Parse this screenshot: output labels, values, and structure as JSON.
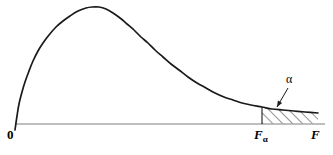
{
  "figure": {
    "type": "probability-density-curve",
    "background_color": "#ffffff",
    "curve_color": "#1a1a1a",
    "axis_color": "#a8a8a8",
    "hatch_color": "#1a1a1a",
    "width": 333,
    "height": 155
  },
  "labels": {
    "origin": "0",
    "critical_value_base": "F",
    "critical_value_subscript": "α",
    "axis_variable": "F",
    "shaded_area": "α"
  },
  "chart_data": {
    "type": "line",
    "title": "",
    "subtitle": "",
    "xlabel": "F",
    "ylabel": "",
    "grid": false,
    "legend": null,
    "xlim": [
      0,
      1
    ],
    "ylim": [
      0,
      1
    ],
    "tick_labels_x": [
      "0",
      "Fα",
      "F"
    ],
    "tick_labels_y": [],
    "annotations": [
      {
        "text": "α",
        "meaning": "area of right-tail rejection region",
        "x_px": 292,
        "y_px": 82,
        "leader_from_px": [
          288,
          88
        ],
        "leader_to_px": [
          277,
          107
        ]
      }
    ],
    "series": [
      {
        "name": "F distribution density",
        "points_px": [
          [
            15,
            130
          ],
          [
            17,
            116
          ],
          [
            19,
            104
          ],
          [
            22,
            92
          ],
          [
            25,
            82
          ],
          [
            29,
            71
          ],
          [
            33,
            61
          ],
          [
            38,
            51
          ],
          [
            43,
            43
          ],
          [
            49,
            35
          ],
          [
            56,
            27
          ],
          [
            63,
            21
          ],
          [
            70,
            16
          ],
          [
            78,
            11
          ],
          [
            86,
            8
          ],
          [
            92,
            7
          ],
          [
            99,
            7
          ],
          [
            106,
            9
          ],
          [
            113,
            13
          ],
          [
            120,
            18
          ],
          [
            127,
            24
          ],
          [
            134,
            30
          ],
          [
            141,
            37
          ],
          [
            148,
            43
          ],
          [
            155,
            50
          ],
          [
            163,
            57
          ],
          [
            171,
            64
          ],
          [
            179,
            70
          ],
          [
            188,
            77
          ],
          [
            197,
            83
          ],
          [
            206,
            88
          ],
          [
            215,
            93
          ],
          [
            224,
            97
          ],
          [
            233,
            100
          ],
          [
            242,
            103
          ],
          [
            251,
            105
          ],
          [
            262,
            107
          ],
          [
            272,
            109
          ],
          [
            283,
            110
          ],
          [
            294,
            111
          ],
          [
            305,
            112
          ],
          [
            318,
            113
          ]
        ]
      }
    ],
    "shaded_region": {
      "label": "α",
      "fill": "diagonal-hatch",
      "from_x_px": 262,
      "to_x_px": 318,
      "baseline_y_px": 124,
      "description": "right tail critical region bounded left by vertical line at F-alpha"
    },
    "baseline": {
      "y_px": 124,
      "x_start_px": 15,
      "x_end_px": 325
    },
    "critical_line": {
      "x_px": 262,
      "y_top_px": 107,
      "y_bottom_px": 124
    }
  }
}
